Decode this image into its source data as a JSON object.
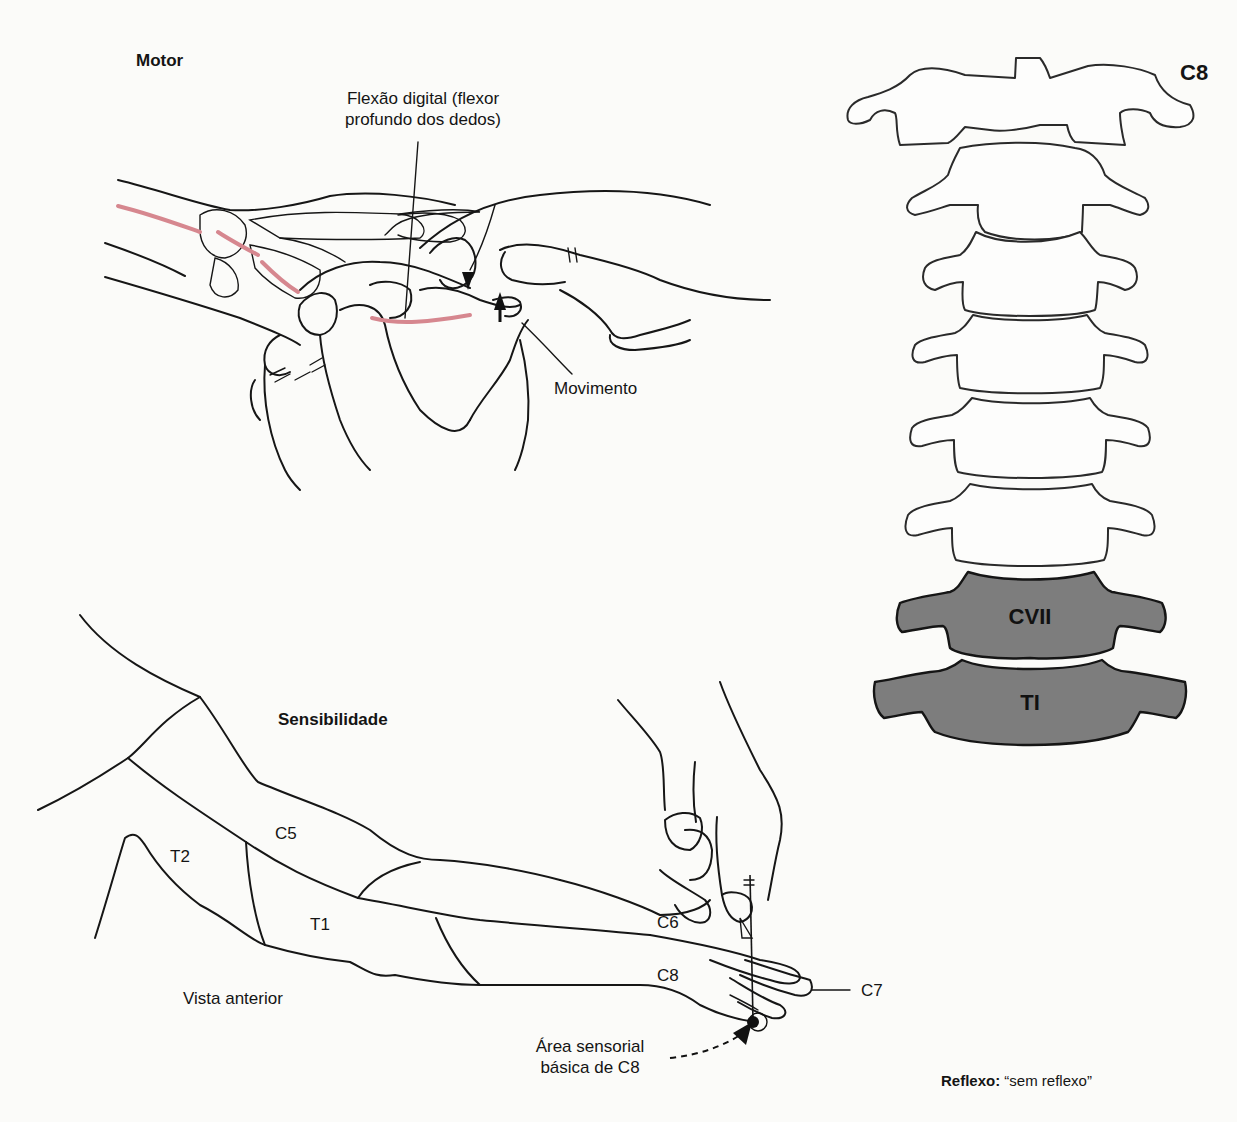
{
  "motor": {
    "heading": "Motor",
    "muscle_label_line1": "Flexão digital (flexor",
    "muscle_label_line2": "profundo dos dedos)",
    "movement_label": "Movimento"
  },
  "spine": {
    "level_label": "C8",
    "highlighted_vertebrae": [
      {
        "label": "CVII"
      },
      {
        "label": "TI"
      }
    ],
    "outline_vertebrae_count": 7,
    "highlight_color": "#7d7d7d"
  },
  "sensory": {
    "heading": "Sensibilidade",
    "view_label": "Vista anterior",
    "dermatomes": {
      "c5": "C5",
      "t2": "T2",
      "t1": "T1",
      "c6": "C6",
      "c8": "C8",
      "c7": "C7"
    },
    "key_area_line1": "Área sensorial",
    "key_area_line2": "básica de C8"
  },
  "reflex": {
    "label": "Reflexo:",
    "value": "“sem reflexo”"
  },
  "colors": {
    "nerve": "#d6878f",
    "line": "#161616",
    "background": "#fbfbf9"
  }
}
